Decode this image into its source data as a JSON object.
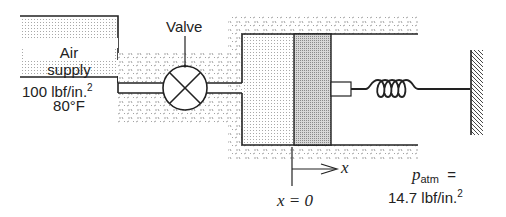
{
  "diagram": {
    "air_supply": {
      "label_line1": "Air",
      "label_line2": "supply",
      "pressure_value": "100 lbf/in.",
      "pressure_exp": "2",
      "temperature": "80°F"
    },
    "valve": {
      "label": "Valve"
    },
    "axis": {
      "var": "x",
      "origin_label": "x = 0"
    },
    "atmosphere": {
      "symbol": "p",
      "subscript": "atm",
      "equals": "=",
      "value": "14.7 lbf/in.",
      "exp": "2"
    },
    "components": [
      "air-supply-tank",
      "pipe",
      "valve",
      "cylinder",
      "piston",
      "piston-rod",
      "spring",
      "fixed-wall"
    ],
    "colors": {
      "line": "#222222",
      "piston_fill": "#b8b8b8",
      "stipple": "#9a9a9a"
    }
  }
}
